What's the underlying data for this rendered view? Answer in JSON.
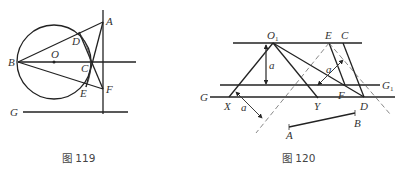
{
  "figures": [
    {
      "caption": "图 119",
      "labels": {
        "A": "A",
        "B": "B",
        "C": "C",
        "D": "D",
        "E": "E",
        "F": "F",
        "G": "G",
        "O": "O"
      }
    },
    {
      "caption": "图 120",
      "labels": {
        "O1_main": "O",
        "O1_sub": "1",
        "E": "E",
        "C": "C",
        "F": "F",
        "D": "D",
        "X": "X",
        "Y": "Y",
        "G": "G",
        "G1_main": "G",
        "G1_sub": "1",
        "A": "A",
        "B": "B",
        "a1": "a",
        "a2": "a",
        "a3": "a"
      }
    }
  ]
}
